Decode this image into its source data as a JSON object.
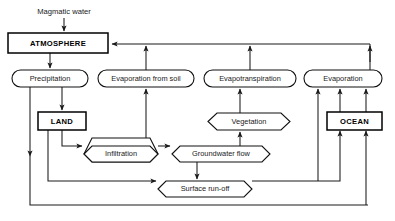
{
  "diagram": {
    "title_clipped": "",
    "free_labels": [
      {
        "id": "magmatic-water",
        "text": "Magmatic water",
        "x": 64,
        "y": 12
      }
    ],
    "nodes": [
      {
        "id": "atmosphere",
        "text": "ATMOSPHERE",
        "shape": "rect-bold",
        "x": 8,
        "y": 33,
        "w": 100,
        "h": 20
      },
      {
        "id": "precipitation",
        "text": "Precipitation",
        "shape": "stadium",
        "x": 12,
        "y": 70,
        "w": 76,
        "h": 17
      },
      {
        "id": "evaporation-from-soil",
        "text": "Evaporation from soil",
        "shape": "stadium",
        "x": 98,
        "y": 70,
        "w": 96,
        "h": 17
      },
      {
        "id": "evapotranspiration",
        "text": "Evapotranspiration",
        "shape": "stadium",
        "x": 204,
        "y": 70,
        "w": 92,
        "h": 17
      },
      {
        "id": "evaporation",
        "text": "Evaporation",
        "shape": "stadium",
        "x": 304,
        "y": 70,
        "w": 78,
        "h": 17
      },
      {
        "id": "land",
        "text": "LAND",
        "shape": "rect-bold",
        "x": 38,
        "y": 112,
        "w": 48,
        "h": 18
      },
      {
        "id": "vegetation",
        "text": "Vegetation",
        "shape": "hex",
        "x": 208,
        "y": 113,
        "w": 82,
        "h": 17
      },
      {
        "id": "ocean",
        "text": "OCEAN",
        "shape": "rect-bold",
        "x": 327,
        "y": 112,
        "w": 55,
        "h": 18
      },
      {
        "id": "infiltration",
        "text": "Infiltration",
        "shape": "hex",
        "x": 84,
        "y": 146,
        "w": 74,
        "h": 16
      },
      {
        "id": "groundwater-flow",
        "text": "Groundwater flow",
        "shape": "hex",
        "x": 172,
        "y": 146,
        "w": 98,
        "h": 16
      },
      {
        "id": "surface-run-off",
        "text": "Surface run-off",
        "shape": "hex",
        "x": 158,
        "y": 181,
        "w": 94,
        "h": 16
      }
    ],
    "edges": [
      {
        "id": "magmatic-to-atmosphere",
        "from": "magmatic-water",
        "to": "atmosphere"
      },
      {
        "id": "atmosphere-to-precipitation",
        "from": "atmosphere",
        "to": "precipitation"
      },
      {
        "id": "precipitation-to-land",
        "from": "precipitation",
        "to": "land"
      },
      {
        "id": "precipitation-to-bottom-loop",
        "from": "precipitation",
        "to": "ocean"
      },
      {
        "id": "land-to-infiltration",
        "from": "land",
        "to": "infiltration"
      },
      {
        "id": "land-to-surface-run-off",
        "from": "land",
        "to": "surface-run-off"
      },
      {
        "id": "infiltration-to-groundwater",
        "from": "infiltration",
        "to": "groundwater-flow"
      },
      {
        "id": "groundwater-to-surface-run-off",
        "from": "groundwater-flow",
        "to": "surface-run-off"
      },
      {
        "id": "groundwater-to-evapotrans",
        "from": "groundwater-flow",
        "to": "evapotranspiration"
      },
      {
        "id": "vegetation-to-evapotrans",
        "from": "vegetation",
        "to": "evapotranspiration"
      },
      {
        "id": "groundwater-to-vegetation",
        "from": "groundwater-flow",
        "to": "vegetation"
      },
      {
        "id": "soil-evap-up",
        "from": "infiltration",
        "to": "evaporation-from-soil"
      },
      {
        "id": "surface-run-off-to-ocean",
        "from": "surface-run-off",
        "to": "ocean"
      },
      {
        "id": "bottom-loop-to-ocean",
        "from": "surface-run-off",
        "to": "ocean"
      },
      {
        "id": "ocean-to-evaporation",
        "from": "ocean",
        "to": "evaporation"
      },
      {
        "id": "surface-run-off-to-evaporation",
        "from": "surface-run-off",
        "to": "evaporation"
      },
      {
        "id": "evap-soil-to-atmosphere",
        "from": "evaporation-from-soil",
        "to": "atmosphere"
      },
      {
        "id": "evapotrans-to-atmosphere",
        "from": "evapotranspiration",
        "to": "atmosphere"
      },
      {
        "id": "evaporation-to-atmosphere",
        "from": "evaporation",
        "to": "atmosphere"
      }
    ],
    "colors": {
      "background": "#ffffff",
      "stroke": "#1a1a1a",
      "text": "#1a1a1a"
    }
  }
}
